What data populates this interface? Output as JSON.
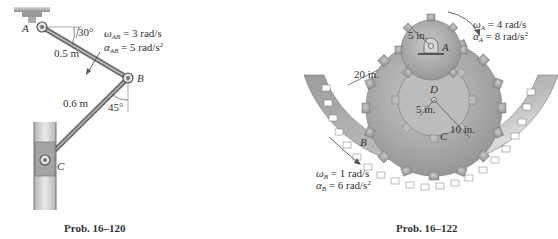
{
  "problems": [
    {
      "id": "16-120",
      "caption": "Prob. 16–120",
      "points": {
        "A": "A",
        "B": "B",
        "C": "C"
      },
      "dimensions": {
        "AB_length": "0.5 m",
        "BC_length": "0.6 m"
      },
      "angles": {
        "AB_angle": "30°",
        "BC_angle": "45°"
      },
      "kinematics": {
        "omega_symbol": "ω",
        "omega_sub": "AB",
        "omega_value": " = 3 rad/s",
        "alpha_symbol": "α",
        "alpha_sub": "AB",
        "alpha_value": " = 5 rad/s",
        "alpha_exp": "2"
      }
    },
    {
      "id": "16-122",
      "caption": "Prob. 16–122",
      "points": {
        "A": "A",
        "B": "B",
        "C": "C",
        "D": "D"
      },
      "dimensions": {
        "gearA_radius": "5 in.",
        "ringB_radius": "20 in.",
        "gearD_inner_radius": "5 in.",
        "gearC_radius": "10 in."
      },
      "kinematics_A": {
        "omega_symbol": "ω",
        "omega_sub": "A",
        "omega_value": " = 4 rad/s",
        "alpha_symbol": "α",
        "alpha_sub": "A",
        "alpha_value": " = 8 rad/s",
        "alpha_exp": "2"
      },
      "kinematics_B": {
        "omega_symbol": "ω",
        "omega_sub": "B",
        "omega_value": " = 1 rad/s",
        "alpha_symbol": "α",
        "alpha_sub": "B",
        "alpha_value": " = 6 rad/s",
        "alpha_exp": "2"
      }
    }
  ],
  "colors": {
    "metal": "#a8a8a8",
    "metal_dark": "#7d7d7d",
    "ink": "#333333"
  }
}
